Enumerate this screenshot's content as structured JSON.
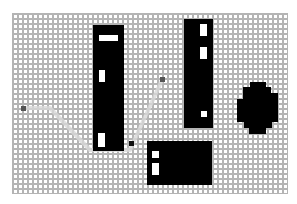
{
  "scene": {
    "type": "grid-pathfinding",
    "grid": {
      "cols": 55,
      "rows": 36,
      "cell_px": 5,
      "line_color": "#b4b4b4",
      "bg_color": "#ffffff"
    },
    "colors": {
      "obstacle": "#000000",
      "start": "#555555",
      "goal": "#555555",
      "waypoint": "#111111",
      "path": "#d8d8d8"
    },
    "start": {
      "x": 21,
      "y": 106
    },
    "goal": {
      "x": 160,
      "y": 77
    },
    "waypoint": {
      "x": 129,
      "y": 141
    },
    "path_points": [
      [
        23,
        108
      ],
      [
        50,
        108
      ],
      [
        90,
        150
      ],
      [
        130,
        150
      ],
      [
        162,
        80
      ]
    ],
    "obstacles": [
      {
        "id": "pillar-left",
        "x": 93,
        "y": 25,
        "w": 31,
        "h": 126,
        "holes": [
          {
            "x": 99,
            "y": 35,
            "w": 19,
            "h": 6
          },
          {
            "x": 99,
            "y": 70,
            "w": 6,
            "h": 12
          },
          {
            "x": 98,
            "y": 133,
            "w": 7,
            "h": 14
          }
        ]
      },
      {
        "id": "pillar-right",
        "x": 184,
        "y": 19,
        "w": 29,
        "h": 109,
        "holes": [
          {
            "x": 200,
            "y": 24,
            "w": 7,
            "h": 12
          },
          {
            "x": 200,
            "y": 47,
            "w": 7,
            "h": 12
          },
          {
            "x": 201,
            "y": 111,
            "w": 6,
            "h": 6
          }
        ]
      },
      {
        "id": "block-bottom",
        "x": 147,
        "y": 141,
        "w": 65,
        "h": 44,
        "holes": [
          {
            "x": 152,
            "y": 151,
            "w": 7,
            "h": 7
          },
          {
            "x": 152,
            "y": 163,
            "w": 7,
            "h": 12
          }
        ]
      }
    ],
    "blob": {
      "id": "round-obstacle",
      "cx": 258,
      "cy": 108,
      "points": "250,82 266,82 266,87 271,87 271,93 278,93 278,122 272,122 272,128 266,128 266,134 249,134 249,128 244,128 244,122 237,122 237,99 243,99 243,87 250,87"
    }
  }
}
